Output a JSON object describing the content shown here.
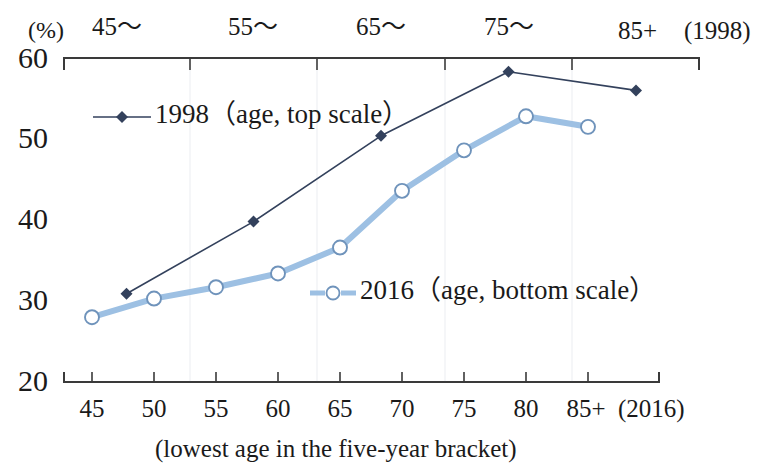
{
  "chart_data": {
    "type": "line",
    "title": "",
    "subtitle": "",
    "ylabel": "(%)",
    "xlabel": "(lowest age in the five-year bracket)",
    "ylim": [
      20,
      60
    ],
    "yticks": [
      20,
      30,
      40,
      50,
      60
    ],
    "grid": false,
    "legend_position": "inside",
    "top_axis": {
      "name": "1998",
      "end_label": "(1998)",
      "categories": [
        "45〜",
        "55〜",
        "65〜",
        "75〜",
        "85+"
      ]
    },
    "bottom_axis": {
      "name": "2016",
      "end_label": "(2016)",
      "categories": [
        "45",
        "50",
        "55",
        "60",
        "65",
        "70",
        "75",
        "80",
        "85+"
      ]
    },
    "series": [
      {
        "name": "1998（age, top scale）",
        "legend_label": "1998（age, top scale）",
        "scale": "top",
        "color": "#33415c",
        "marker": "filled-diamond",
        "categories": [
          "45〜",
          "55〜",
          "65〜",
          "75〜",
          "85+"
        ],
        "values": [
          30.9,
          39.8,
          50.4,
          58.3,
          56.0
        ]
      },
      {
        "name": "2016（age, bottom scale）",
        "legend_label": "2016（age, bottom scale）",
        "scale": "bottom",
        "color": "#9dc0e3",
        "marker": "open-circle",
        "categories": [
          "45",
          "50",
          "55",
          "60",
          "65",
          "70",
          "75",
          "80",
          "85+"
        ],
        "values": [
          28.0,
          30.3,
          31.7,
          33.4,
          36.6,
          43.6,
          48.6,
          52.8,
          51.5
        ]
      }
    ]
  },
  "axes": {
    "y_unit": "(%)",
    "y_tick_labels": [
      "60",
      "50",
      "40",
      "30",
      "20"
    ],
    "top_tick_labels": [
      "45〜",
      "55〜",
      "65〜",
      "75〜",
      "85+"
    ],
    "top_end_label": "(1998)",
    "bottom_tick_labels": [
      "45",
      "50",
      "55",
      "60",
      "65",
      "70",
      "75",
      "80",
      "85+"
    ],
    "bottom_end_label": "(2016)",
    "x_axis_title": "(lowest age in the five-year bracket)"
  },
  "legend": {
    "entry_1998": "1998（age, top scale）",
    "entry_2016": "2016（age, bottom scale）"
  }
}
